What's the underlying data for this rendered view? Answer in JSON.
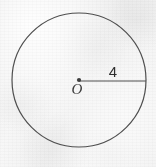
{
  "figure": {
    "type": "geometry-diagram",
    "background_color": "#f2f2f2",
    "stroke_color": "#4a4a4a",
    "canvas": {
      "width": 156,
      "height": 167
    },
    "circle": {
      "center_x": 79,
      "center_y": 80,
      "radius_px": 67,
      "stroke_width": 1.2
    },
    "center_point": {
      "label": "O",
      "dot_radius": 2.1,
      "x": 79,
      "y": 80,
      "label_x": 77,
      "label_y": 93
    },
    "radius_segment": {
      "label": "4",
      "x1": 79,
      "y1": 81,
      "x2": 146,
      "y2": 81,
      "stroke_width": 1.2,
      "label_x": 113,
      "label_y": 77
    }
  }
}
